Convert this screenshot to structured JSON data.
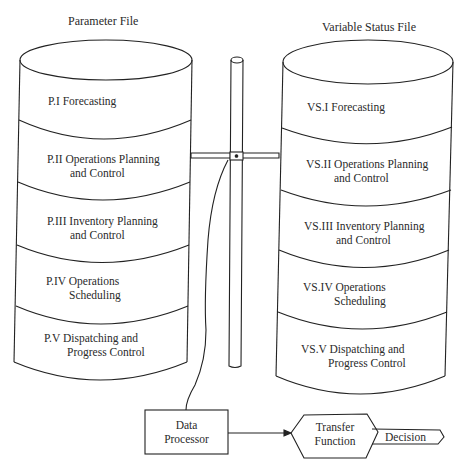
{
  "parameter_file": {
    "title": "Parameter File",
    "segments": [
      {
        "line1": "P.I Forecasting",
        "line2": ""
      },
      {
        "line1": "P.II  Operations Planning",
        "line2": "and Control"
      },
      {
        "line1": "P.III Inventory Planning",
        "line2": "and Control"
      },
      {
        "line1": "P.IV Operations",
        "line2": "Scheduling"
      },
      {
        "line1": "P.V Dispatching and",
        "line2": "Progress Control"
      }
    ]
  },
  "variable_status_file": {
    "title": "Variable Status File",
    "segments": [
      {
        "line1": "VS.I Forecasting",
        "line2": ""
      },
      {
        "line1": "VS.II Operations Planning",
        "line2": "and Control"
      },
      {
        "line1": "VS.III Inventory Planning",
        "line2": "and Control"
      },
      {
        "line1": "VS.IV Operations",
        "line2": "Scheduling"
      },
      {
        "line1": "VS.V Dispatching and",
        "line2": "Progress Control"
      }
    ]
  },
  "data_processor": {
    "line1": "Data",
    "line2": "Processor"
  },
  "transfer_function": {
    "line1": "Transfer",
    "line2": "Function"
  },
  "decision": {
    "label": "Decision"
  },
  "colors": {
    "stroke": "#222222",
    "background": "#ffffff"
  }
}
